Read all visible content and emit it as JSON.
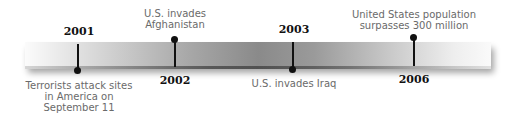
{
  "timeline": {
    "events": [
      {
        "year": "2001",
        "label": "Terrorists attack sites\nin America on\nSeptember 11",
        "position": "below"
      },
      {
        "year": "2002",
        "label": "U.S. invades\nAfghanistan",
        "position": "above"
      },
      {
        "year": "2003",
        "label": "U.S. invades Iraq",
        "position": "below"
      },
      {
        "year": "2006",
        "label": "United States population\nsurpasses 300 million",
        "position": "above"
      }
    ]
  }
}
